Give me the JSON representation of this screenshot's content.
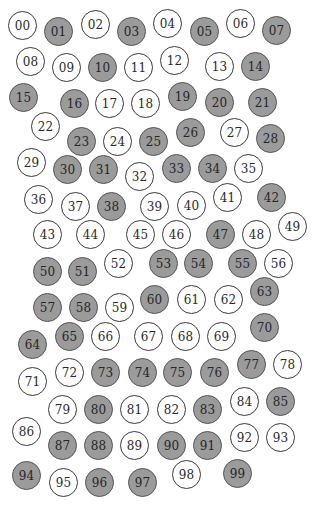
{
  "colors": {
    "filled": "#9b9b9b",
    "empty": "#ffffff",
    "stroke": "#3a3a3a"
  },
  "circles": [
    {
      "label": "00",
      "x": 23,
      "y": 26,
      "filled": false
    },
    {
      "label": "01",
      "x": 59,
      "y": 32,
      "filled": true
    },
    {
      "label": "02",
      "x": 96,
      "y": 25,
      "filled": false
    },
    {
      "label": "03",
      "x": 132,
      "y": 32,
      "filled": true
    },
    {
      "label": "04",
      "x": 168,
      "y": 24,
      "filled": false
    },
    {
      "label": "05",
      "x": 205,
      "y": 32,
      "filled": true
    },
    {
      "label": "06",
      "x": 241,
      "y": 24,
      "filled": false
    },
    {
      "label": "07",
      "x": 277,
      "y": 31,
      "filled": true
    },
    {
      "label": "08",
      "x": 31,
      "y": 62,
      "filled": false
    },
    {
      "label": "09",
      "x": 67,
      "y": 68,
      "filled": false
    },
    {
      "label": "10",
      "x": 103,
      "y": 68,
      "filled": true
    },
    {
      "label": "11",
      "x": 139,
      "y": 68,
      "filled": false
    },
    {
      "label": "12",
      "x": 175,
      "y": 61,
      "filled": false
    },
    {
      "label": "13",
      "x": 220,
      "y": 67,
      "filled": false
    },
    {
      "label": "14",
      "x": 256,
      "y": 67,
      "filled": true
    },
    {
      "label": "15",
      "x": 24,
      "y": 98,
      "filled": true
    },
    {
      "label": "16",
      "x": 75,
      "y": 104,
      "filled": true
    },
    {
      "label": "17",
      "x": 110,
      "y": 104,
      "filled": false
    },
    {
      "label": "18",
      "x": 146,
      "y": 104,
      "filled": false
    },
    {
      "label": "19",
      "x": 183,
      "y": 97,
      "filled": true
    },
    {
      "label": "20",
      "x": 220,
      "y": 103,
      "filled": true
    },
    {
      "label": "21",
      "x": 263,
      "y": 103,
      "filled": true
    },
    {
      "label": "22",
      "x": 46,
      "y": 127,
      "filled": false
    },
    {
      "label": "23",
      "x": 82,
      "y": 142,
      "filled": true
    },
    {
      "label": "24",
      "x": 118,
      "y": 142,
      "filled": false
    },
    {
      "label": "25",
      "x": 154,
      "y": 142,
      "filled": true
    },
    {
      "label": "26",
      "x": 191,
      "y": 133,
      "filled": true
    },
    {
      "label": "27",
      "x": 235,
      "y": 133,
      "filled": false
    },
    {
      "label": "28",
      "x": 271,
      "y": 139,
      "filled": true
    },
    {
      "label": "29",
      "x": 32,
      "y": 163,
      "filled": false
    },
    {
      "label": "30",
      "x": 68,
      "y": 170,
      "filled": true
    },
    {
      "label": "31",
      "x": 104,
      "y": 170,
      "filled": true
    },
    {
      "label": "32",
      "x": 140,
      "y": 177,
      "filled": false
    },
    {
      "label": "33",
      "x": 177,
      "y": 169,
      "filled": true
    },
    {
      "label": "34",
      "x": 213,
      "y": 169,
      "filled": true
    },
    {
      "label": "35",
      "x": 249,
      "y": 169,
      "filled": false
    },
    {
      "label": "36",
      "x": 39,
      "y": 200,
      "filled": false
    },
    {
      "label": "37",
      "x": 76,
      "y": 207,
      "filled": false
    },
    {
      "label": "38",
      "x": 112,
      "y": 207,
      "filled": true
    },
    {
      "label": "39",
      "x": 155,
      "y": 207,
      "filled": false
    },
    {
      "label": "40",
      "x": 192,
      "y": 206,
      "filled": false
    },
    {
      "label": "41",
      "x": 228,
      "y": 198,
      "filled": false
    },
    {
      "label": "42",
      "x": 272,
      "y": 198,
      "filled": true
    },
    {
      "label": "43",
      "x": 48,
      "y": 235,
      "filled": false
    },
    {
      "label": "44",
      "x": 91,
      "y": 235,
      "filled": false
    },
    {
      "label": "45",
      "x": 141,
      "y": 235,
      "filled": false
    },
    {
      "label": "46",
      "x": 177,
      "y": 235,
      "filled": false
    },
    {
      "label": "47",
      "x": 221,
      "y": 235,
      "filled": true
    },
    {
      "label": "48",
      "x": 257,
      "y": 235,
      "filled": false
    },
    {
      "label": "49",
      "x": 293,
      "y": 227,
      "filled": false
    },
    {
      "label": "50",
      "x": 48,
      "y": 272,
      "filled": true
    },
    {
      "label": "51",
      "x": 83,
      "y": 272,
      "filled": true
    },
    {
      "label": "52",
      "x": 119,
      "y": 264,
      "filled": false
    },
    {
      "label": "53",
      "x": 164,
      "y": 264,
      "filled": true
    },
    {
      "label": "54",
      "x": 199,
      "y": 264,
      "filled": true
    },
    {
      "label": "55",
      "x": 243,
      "y": 264,
      "filled": true
    },
    {
      "label": "56",
      "x": 279,
      "y": 264,
      "filled": false
    },
    {
      "label": "57",
      "x": 48,
      "y": 308,
      "filled": true
    },
    {
      "label": "58",
      "x": 84,
      "y": 308,
      "filled": true
    },
    {
      "label": "59",
      "x": 120,
      "y": 308,
      "filled": false
    },
    {
      "label": "60",
      "x": 155,
      "y": 300,
      "filled": true
    },
    {
      "label": "61",
      "x": 192,
      "y": 300,
      "filled": false
    },
    {
      "label": "62",
      "x": 229,
      "y": 300,
      "filled": false
    },
    {
      "label": "63",
      "x": 265,
      "y": 292,
      "filled": true
    },
    {
      "label": "64",
      "x": 33,
      "y": 345,
      "filled": true
    },
    {
      "label": "65",
      "x": 70,
      "y": 337,
      "filled": true
    },
    {
      "label": "66",
      "x": 106,
      "y": 337,
      "filled": false
    },
    {
      "label": "67",
      "x": 149,
      "y": 337,
      "filled": false
    },
    {
      "label": "68",
      "x": 186,
      "y": 337,
      "filled": false
    },
    {
      "label": "69",
      "x": 222,
      "y": 337,
      "filled": false
    },
    {
      "label": "70",
      "x": 265,
      "y": 328,
      "filled": true
    },
    {
      "label": "71",
      "x": 33,
      "y": 382,
      "filled": false
    },
    {
      "label": "72",
      "x": 70,
      "y": 373,
      "filled": false
    },
    {
      "label": "73",
      "x": 106,
      "y": 373,
      "filled": true
    },
    {
      "label": "74",
      "x": 143,
      "y": 373,
      "filled": true
    },
    {
      "label": "75",
      "x": 178,
      "y": 373,
      "filled": true
    },
    {
      "label": "76",
      "x": 215,
      "y": 373,
      "filled": true
    },
    {
      "label": "77",
      "x": 252,
      "y": 365,
      "filled": true
    },
    {
      "label": "78",
      "x": 288,
      "y": 365,
      "filled": false
    },
    {
      "label": "79",
      "x": 63,
      "y": 410,
      "filled": false
    },
    {
      "label": "80",
      "x": 99,
      "y": 410,
      "filled": true
    },
    {
      "label": "81",
      "x": 135,
      "y": 410,
      "filled": false
    },
    {
      "label": "82",
      "x": 172,
      "y": 410,
      "filled": false
    },
    {
      "label": "83",
      "x": 208,
      "y": 410,
      "filled": true
    },
    {
      "label": "84",
      "x": 245,
      "y": 402,
      "filled": false
    },
    {
      "label": "85",
      "x": 281,
      "y": 402,
      "filled": true
    },
    {
      "label": "86",
      "x": 27,
      "y": 432,
      "filled": false
    },
    {
      "label": "87",
      "x": 63,
      "y": 446,
      "filled": true
    },
    {
      "label": "88",
      "x": 99,
      "y": 446,
      "filled": true
    },
    {
      "label": "89",
      "x": 135,
      "y": 446,
      "filled": false
    },
    {
      "label": "90",
      "x": 172,
      "y": 446,
      "filled": true
    },
    {
      "label": "91",
      "x": 208,
      "y": 446,
      "filled": true
    },
    {
      "label": "92",
      "x": 245,
      "y": 438,
      "filled": false
    },
    {
      "label": "93",
      "x": 281,
      "y": 438,
      "filled": false
    },
    {
      "label": "94",
      "x": 27,
      "y": 476,
      "filled": true
    },
    {
      "label": "95",
      "x": 64,
      "y": 483,
      "filled": false
    },
    {
      "label": "96",
      "x": 100,
      "y": 483,
      "filled": true
    },
    {
      "label": "97",
      "x": 143,
      "y": 483,
      "filled": true
    },
    {
      "label": "98",
      "x": 187,
      "y": 475,
      "filled": false
    },
    {
      "label": "99",
      "x": 238,
      "y": 474,
      "filled": true
    }
  ]
}
